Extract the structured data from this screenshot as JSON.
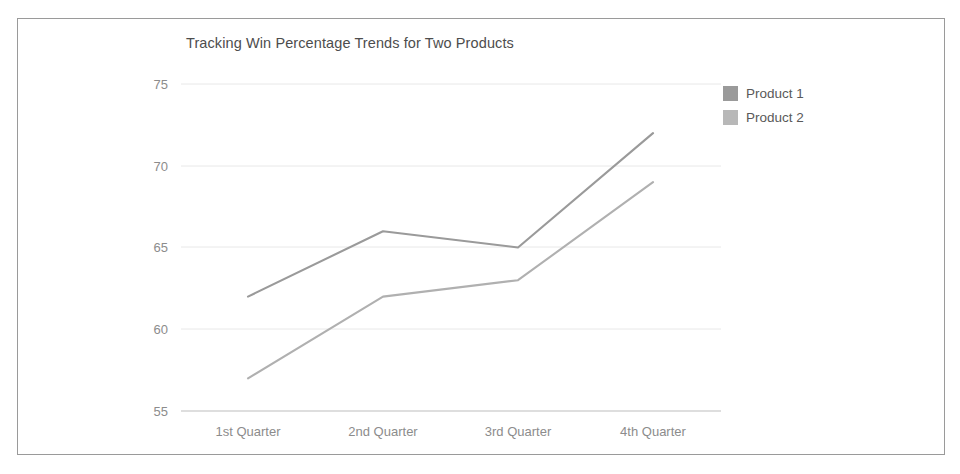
{
  "chart_data": {
    "type": "line",
    "title": "Tracking Win Percentage Trends for Two Products",
    "xlabel": "",
    "ylabel": "",
    "categories": [
      "1st Quarter",
      "2nd Quarter",
      "3rd Quarter",
      "4th Quarter"
    ],
    "series": [
      {
        "name": "Product 1",
        "values": [
          62,
          66,
          65,
          72
        ],
        "color": "#9a9a9a"
      },
      {
        "name": "Product 2",
        "values": [
          57,
          62,
          63,
          69
        ],
        "color": "#b0b0b0"
      }
    ],
    "ylim": [
      55,
      75
    ],
    "yticks": [
      "55",
      "60",
      "65",
      "70",
      "75"
    ],
    "grid": true,
    "legend_position": "right"
  },
  "legend": {
    "items": [
      {
        "label": "Product 1",
        "swatch": "#9a9a9a"
      },
      {
        "label": "Product 2",
        "swatch": "#b8b8b8"
      }
    ]
  },
  "axes": {
    "y_ticks": [
      {
        "label": "75"
      },
      {
        "label": "70"
      },
      {
        "label": "65"
      },
      {
        "label": "60"
      },
      {
        "label": "55"
      }
    ],
    "x_ticks": [
      {
        "label": "1st Quarter"
      },
      {
        "label": "2nd Quarter"
      },
      {
        "label": "3rd Quarter"
      },
      {
        "label": "4th Quarter"
      }
    ]
  }
}
